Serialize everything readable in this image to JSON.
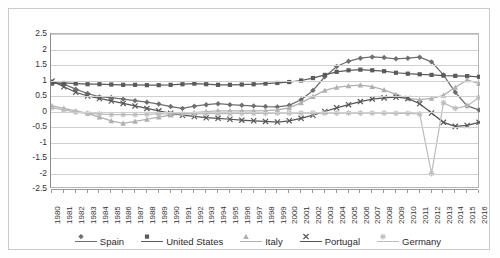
{
  "chart_data": {
    "type": "line",
    "title": "",
    "xlabel": "",
    "ylabel": "",
    "ylim": [
      -2.5,
      2.5
    ],
    "ytick_step": 0.5,
    "yticks": [
      "2.5",
      "2",
      "1.5",
      "1",
      "0.5",
      "0",
      "-0.5",
      "-1",
      "-1.5",
      "-2",
      "-2.5"
    ],
    "grid": true,
    "legend_position": "bottom",
    "x": [
      1980,
      1981,
      1982,
      1983,
      1984,
      1985,
      1986,
      1987,
      1988,
      1989,
      1990,
      1991,
      1992,
      1993,
      1994,
      1995,
      1996,
      1997,
      1998,
      1999,
      2000,
      2001,
      2002,
      2003,
      2004,
      2005,
      2006,
      2007,
      2008,
      2009,
      2010,
      2011,
      2012,
      2013,
      2014,
      2015,
      2016
    ],
    "categories": [
      "1980",
      "1981",
      "1982",
      "1983",
      "1984",
      "1985",
      "1986",
      "1987",
      "1988",
      "1989",
      "1990",
      "1991",
      "1992",
      "1993",
      "1994",
      "1995",
      "1996",
      "1997",
      "1998",
      "1999",
      "2000",
      "2001",
      "2002",
      "2003",
      "2004",
      "2005",
      "2006",
      "2007",
      "2008",
      "2009",
      "2010",
      "2011",
      "2012",
      "2013",
      "2014",
      "2015",
      "2016"
    ],
    "series": [
      {
        "name": "Spain",
        "marker": "diamond",
        "color": "#6e6e6e",
        "values": [
          0.95,
          0.88,
          0.72,
          0.58,
          0.47,
          0.45,
          0.4,
          0.35,
          0.3,
          0.24,
          0.16,
          0.1,
          0.17,
          0.22,
          0.25,
          0.22,
          0.2,
          0.18,
          0.16,
          0.15,
          0.2,
          0.38,
          0.68,
          1.12,
          1.45,
          1.62,
          1.72,
          1.76,
          1.74,
          1.7,
          1.72,
          1.75,
          1.6,
          1.18,
          0.62,
          0.18,
          0.05
        ]
      },
      {
        "name": "United States",
        "marker": "square",
        "color": "#5a5a5a",
        "values": [
          0.9,
          0.92,
          0.9,
          0.88,
          0.88,
          0.87,
          0.86,
          0.86,
          0.85,
          0.85,
          0.86,
          0.88,
          0.9,
          0.88,
          0.86,
          0.86,
          0.87,
          0.88,
          0.9,
          0.92,
          0.95,
          1.0,
          1.08,
          1.18,
          1.28,
          1.33,
          1.35,
          1.33,
          1.3,
          1.25,
          1.22,
          1.2,
          1.18,
          1.16,
          1.15,
          1.14,
          1.12
        ]
      },
      {
        "name": "Italy",
        "marker": "triangle",
        "color": "#b0b0b0",
        "values": [
          0.18,
          0.1,
          0.02,
          -0.06,
          -0.18,
          -0.3,
          -0.38,
          -0.32,
          -0.25,
          -0.18,
          -0.12,
          -0.08,
          -0.04,
          0.0,
          0.02,
          0.02,
          0.02,
          0.02,
          0.03,
          0.05,
          0.12,
          0.28,
          0.48,
          0.68,
          0.78,
          0.83,
          0.85,
          0.8,
          0.7,
          0.55,
          0.42,
          0.38,
          0.42,
          0.52,
          0.78,
          1.02,
          0.9
        ]
      },
      {
        "name": "Portugal",
        "marker": "cross",
        "color": "#565656",
        "values": [
          0.98,
          0.8,
          0.62,
          0.5,
          0.42,
          0.34,
          0.26,
          0.18,
          0.1,
          0.02,
          -0.06,
          -0.12,
          -0.16,
          -0.2,
          -0.22,
          -0.25,
          -0.28,
          -0.3,
          -0.32,
          -0.34,
          -0.3,
          -0.22,
          -0.12,
          0.0,
          0.12,
          0.22,
          0.32,
          0.4,
          0.44,
          0.46,
          0.42,
          0.25,
          -0.05,
          -0.35,
          -0.48,
          -0.45,
          -0.35
        ]
      },
      {
        "name": "Germany",
        "marker": "star",
        "color": "#bcbcbc",
        "values": [
          0.12,
          0.05,
          -0.02,
          -0.06,
          -0.08,
          -0.1,
          -0.1,
          -0.1,
          -0.09,
          -0.08,
          -0.08,
          -0.08,
          -0.08,
          -0.07,
          -0.07,
          -0.07,
          -0.06,
          -0.06,
          -0.06,
          -0.05,
          -0.05,
          -0.05,
          -0.05,
          -0.05,
          -0.05,
          -0.05,
          -0.05,
          -0.05,
          -0.05,
          -0.06,
          -0.06,
          -0.08,
          -2.0,
          0.28,
          0.1,
          0.18,
          0.45
        ]
      }
    ]
  },
  "legend": {
    "items": [
      {
        "label": "Spain",
        "marker": "diamond-marker",
        "color": "#6e6e6e"
      },
      {
        "label": "United States",
        "marker": "square-marker",
        "color": "#5a5a5a"
      },
      {
        "label": "Italy",
        "marker": "triangle-marker",
        "color": "#b0b0b0"
      },
      {
        "label": "Portugal",
        "marker": "cross-marker",
        "color": "#565656"
      },
      {
        "label": "Germany",
        "marker": "star-marker",
        "color": "#bcbcbc"
      }
    ]
  }
}
